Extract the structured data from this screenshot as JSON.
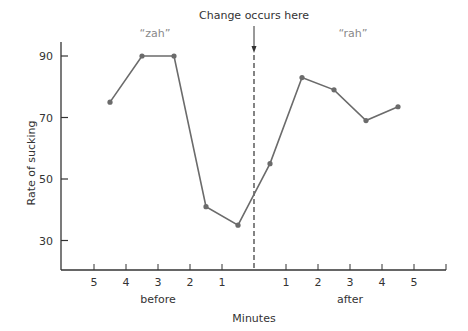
{
  "chart_data": {
    "type": "line",
    "title": "",
    "xlabel": "Minutes",
    "ylabel": "Rate of sucking",
    "ylim": [
      20,
      95
    ],
    "yticks": [
      30,
      50,
      70,
      90
    ],
    "x_group_labels": {
      "before": "before",
      "after": "after"
    },
    "x_tick_labels_before": [
      "5",
      "4",
      "3",
      "2",
      "1"
    ],
    "x_tick_labels_after": [
      "1",
      "2",
      "3",
      "4",
      "5"
    ],
    "annotation": {
      "text": "Change occurs here",
      "position": "x=0 (dashed vertical line)"
    },
    "phase_labels": [
      {
        "text": "“zah”",
        "phase": "before"
      },
      {
        "text": "“rah”",
        "phase": "after"
      }
    ],
    "x": [
      -4.5,
      -3.5,
      -2.5,
      -1.5,
      -0.5,
      0.5,
      1.5,
      2.5,
      3.5,
      4.5
    ],
    "series": [
      {
        "name": "Rate of sucking",
        "values": [
          75,
          90,
          90,
          41,
          35,
          55,
          83,
          79,
          69,
          73.5
        ]
      }
    ],
    "grid": false,
    "legend": "none"
  },
  "colors": {
    "line": "#6b6b6b",
    "axis": "#333333",
    "text": "#333333",
    "phase_text": "#888888"
  }
}
